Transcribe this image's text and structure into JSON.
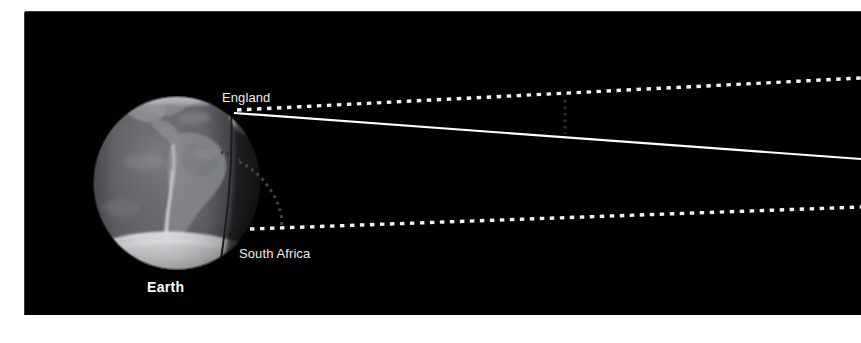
{
  "figure": {
    "background_color": "#ffffff",
    "panel_color": "#000000",
    "panel_label": "night-sky-panel"
  },
  "labels": {
    "england": "England",
    "south_africa": "South Africa",
    "earth": "Earth"
  },
  "colors": {
    "page_background": "#ffffff",
    "sky": "#000000",
    "label_text": "#ececec",
    "earth_label_text": "#ffffff",
    "sightline": "#ffffff",
    "dotted_ray": "#f2f2f2",
    "faint_arc": "#3c3c3c",
    "ocean": "#56585c",
    "land": "#8e9094",
    "ice_cap": "#f4f6f8",
    "night_side": "#0a0a0b"
  },
  "diagram": {
    "type": "astronomy-sightline-schematic",
    "subject": "Earth",
    "observation_sites": [
      "England",
      "South Africa"
    ],
    "elements": [
      {
        "name": "earth-globe",
        "description": "grayscale satellite view of Earth showing the Americas, with Antarctic ice cap and a day/night terminator on the right limb",
        "center_x": 177,
        "center_y": 183,
        "radius_x": 84,
        "radius_y": 87
      },
      {
        "name": "upper-dotted-ray",
        "description": "dotted sightline leaving the globe at the England latitude, rising slightly to the right",
        "origin_x": 237,
        "origin_y": 110,
        "end_x": 861,
        "end_y": 78
      },
      {
        "name": "lower-dotted-ray",
        "description": "dotted sightline leaving the globe at the South Africa latitude, rising slightly to the right",
        "origin_x": 250,
        "origin_y": 229,
        "end_x": 861,
        "end_y": 207
      },
      {
        "name": "solid-sightline",
        "description": "solid white line from the England point angling down toward the right edge",
        "origin_x": 235,
        "origin_y": 113,
        "end_x": 861,
        "end_y": 158
      },
      {
        "name": "terminator-arc",
        "description": "faint grey dotted arc tracing the curve of the night-side limb",
        "visible": true
      },
      {
        "name": "vertical-tick-marker",
        "description": "faint vertical dotted tick in the open sky region",
        "x": 565,
        "y_top": 100,
        "y_bottom": 130
      }
    ]
  }
}
